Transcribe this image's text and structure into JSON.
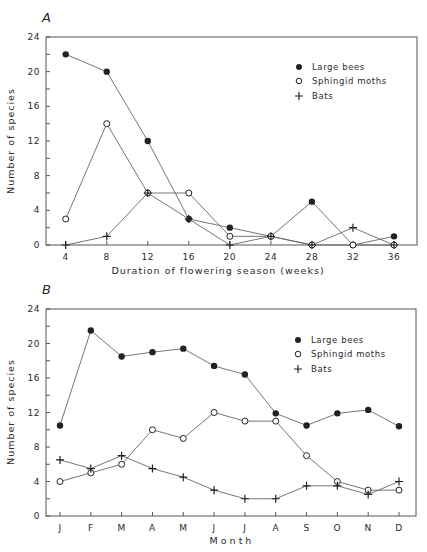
{
  "chart_data": [
    {
      "panel": "A",
      "type": "line",
      "title": "",
      "xlabel": "Duration of flowering season (weeks)",
      "ylabel": "Number of species",
      "x": [
        4,
        8,
        12,
        16,
        20,
        24,
        28,
        32,
        36
      ],
      "xticks": [
        "4",
        "8",
        "12",
        "16",
        "20",
        "24",
        "28",
        "32",
        "36"
      ],
      "yticks": [
        "0",
        "4",
        "8",
        "12",
        "16",
        "20",
        "24"
      ],
      "ylim": [
        0,
        24
      ],
      "xlim": [
        2,
        37
      ],
      "grid": false,
      "legend_position": "upper right",
      "series": [
        {
          "name": "Large bees",
          "marker": "filled-circle",
          "values": [
            22,
            20,
            12,
            3,
            2,
            1,
            5,
            0,
            1
          ]
        },
        {
          "name": "Sphingid moths",
          "marker": "open-circle",
          "values": [
            3,
            14,
            6,
            6,
            1,
            1,
            0,
            0,
            0
          ]
        },
        {
          "name": "Bats",
          "marker": "plus",
          "values": [
            0,
            1,
            6,
            3,
            0,
            1,
            0,
            2,
            0
          ]
        }
      ]
    },
    {
      "panel": "B",
      "type": "line",
      "title": "",
      "xlabel": "Month",
      "ylabel": "Number of species",
      "categories": [
        "J",
        "F",
        "M",
        "A",
        "M",
        "J",
        "J",
        "A",
        "S",
        "O",
        "N",
        "D"
      ],
      "yticks": [
        "0",
        "4",
        "8",
        "12",
        "16",
        "20",
        "24"
      ],
      "ylim": [
        0,
        24
      ],
      "grid": false,
      "legend_position": "upper right",
      "series": [
        {
          "name": "Large bees",
          "marker": "filled-circle",
          "values": [
            10.5,
            21.5,
            18.5,
            19,
            19.4,
            17.4,
            16.4,
            11.9,
            10.5,
            11.9,
            12.3,
            10.4
          ]
        },
        {
          "name": "Sphingid moths",
          "marker": "open-circle",
          "values": [
            4,
            5,
            6,
            10,
            9,
            12,
            11,
            11,
            7,
            4,
            3,
            3
          ]
        },
        {
          "name": "Bats",
          "marker": "plus",
          "values": [
            6.5,
            5.5,
            7,
            5.5,
            4.5,
            3,
            2,
            2,
            3.5,
            3.5,
            2.5,
            4
          ]
        }
      ]
    }
  ],
  "panels": {
    "a": {
      "label": "A",
      "xlabel": "Duration of flowering season (weeks)",
      "ylabel": "Number of species",
      "legend": [
        "Large bees",
        "Sphingid moths",
        "Bats"
      ]
    },
    "b": {
      "label": "B",
      "xlabel": "Month",
      "ylabel": "Number of species",
      "legend": [
        "Large bees",
        "Sphingid moths",
        "Bats"
      ]
    }
  },
  "colors": {
    "ink": "#2a2a2a",
    "line": "#555555",
    "background": "#ffffff"
  }
}
